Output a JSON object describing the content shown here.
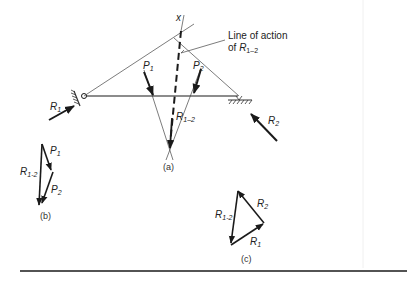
{
  "figure": {
    "part_a": {
      "caption": "(a)",
      "apex_label": "x",
      "annotation_line1": "Line of action",
      "annotation_line2_prefix": "of ",
      "annotation_symbol": "R",
      "annotation_sub": "1–2",
      "forces": {
        "P1": {
          "symbol": "P",
          "sub": "1"
        },
        "P2": {
          "symbol": "P",
          "sub": "2"
        },
        "R1": {
          "symbol": "R",
          "sub": "1"
        },
        "R2": {
          "symbol": "R",
          "sub": "2"
        },
        "R12": {
          "symbol": "R",
          "sub": "1–2"
        }
      }
    },
    "part_b": {
      "caption": "(b)",
      "labels": {
        "P1": {
          "symbol": "P",
          "sub": "1"
        },
        "P2": {
          "symbol": "P",
          "sub": "2"
        },
        "R12": {
          "symbol": "R",
          "sub": "1-2"
        }
      }
    },
    "part_c": {
      "caption": "(c)",
      "labels": {
        "R1": {
          "symbol": "R",
          "sub": "1"
        },
        "R2": {
          "symbol": "R",
          "sub": "2"
        },
        "R12": {
          "symbol": "R",
          "sub": "1-2"
        }
      }
    }
  },
  "colors": {
    "ink": "#1a1a1a",
    "thin_line": "#444444",
    "background": "#ffffff"
  }
}
